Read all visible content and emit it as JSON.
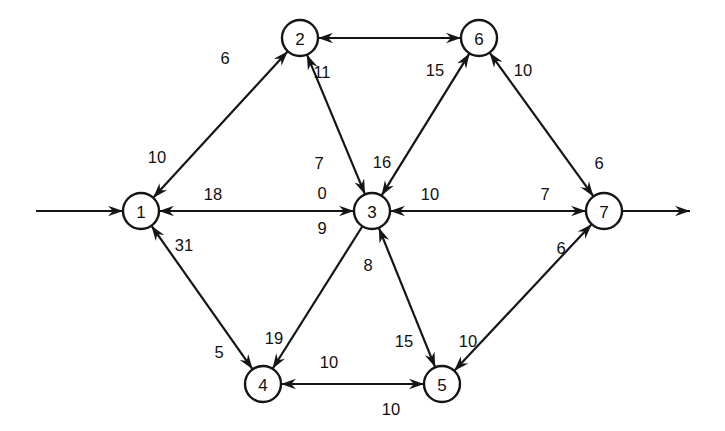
{
  "diagram": {
    "type": "directed-network-graph",
    "title": "",
    "background_color": "#ffffff",
    "line_color": "#151515",
    "node_fill": "#ffffff",
    "node_radius": 18,
    "nodes": [
      {
        "id": "1",
        "label": "1",
        "x": 141,
        "y": 211
      },
      {
        "id": "2",
        "label": "2",
        "x": 300,
        "y": 38
      },
      {
        "id": "3",
        "label": "3",
        "x": 372,
        "y": 211
      },
      {
        "id": "4",
        "label": "4",
        "x": 263,
        "y": 384
      },
      {
        "id": "5",
        "label": "5",
        "x": 442,
        "y": 384
      },
      {
        "id": "6",
        "label": "6",
        "x": 479,
        "y": 38
      },
      {
        "id": "7",
        "label": "7",
        "x": 604,
        "y": 211
      }
    ],
    "edges": [
      {
        "from": "1",
        "to": "2",
        "weight": "6",
        "label_x": 225,
        "label_y": 58,
        "arrow": "to"
      },
      {
        "from": "2",
        "to": "1",
        "weight": "10",
        "label_x": 157,
        "label_y": 157,
        "arrow": "to"
      },
      {
        "from": "2",
        "to": "6",
        "weight": "",
        "label_x": 390,
        "label_y": 20,
        "arrow": "both"
      },
      {
        "from": "3",
        "to": "2",
        "weight": "11",
        "label_x": 322,
        "label_y": 72,
        "arrow": "to"
      },
      {
        "from": "2",
        "to": "3",
        "weight": "7",
        "label_x": 319,
        "label_y": 163,
        "arrow": "to"
      },
      {
        "from": "1",
        "to": "3",
        "weight": "0",
        "label_x": 322,
        "label_y": 193,
        "arrow": "to"
      },
      {
        "from": "3",
        "to": "1",
        "weight": "18",
        "label_x": 213,
        "label_y": 194,
        "arrow": "to"
      },
      {
        "from": "1",
        "to": "3",
        "weight": "9",
        "label_x": 322,
        "label_y": 228,
        "arrow": "none"
      },
      {
        "from": "3",
        "to": "6",
        "weight": "15",
        "label_x": 435,
        "label_y": 70,
        "arrow": "to"
      },
      {
        "from": "6",
        "to": "3",
        "weight": "16",
        "label_x": 382,
        "label_y": 162,
        "arrow": "to"
      },
      {
        "from": "7",
        "to": "6",
        "weight": "10",
        "label_x": 523,
        "label_y": 70,
        "arrow": "to"
      },
      {
        "from": "6",
        "to": "7",
        "weight": "6",
        "label_x": 599,
        "label_y": 163,
        "arrow": "to"
      },
      {
        "from": "3",
        "to": "7",
        "weight": "7",
        "label_x": 545,
        "label_y": 194,
        "arrow": "to"
      },
      {
        "from": "7",
        "to": "3",
        "weight": "10",
        "label_x": 430,
        "label_y": 194,
        "arrow": "to"
      },
      {
        "from": "4",
        "to": "1",
        "weight": "31",
        "label_x": 184,
        "label_y": 245,
        "arrow": "to"
      },
      {
        "from": "1",
        "to": "4",
        "weight": "5",
        "label_x": 219,
        "label_y": 352,
        "arrow": "to"
      },
      {
        "from": "3",
        "to": "4",
        "weight": "19",
        "label_x": 274,
        "label_y": 338,
        "arrow": "to"
      },
      {
        "from": "5",
        "to": "3",
        "weight": "8",
        "label_x": 368,
        "label_y": 265,
        "arrow": "to"
      },
      {
        "from": "3",
        "to": "5",
        "weight": "15",
        "label_x": 404,
        "label_y": 341,
        "arrow": "to"
      },
      {
        "from": "5",
        "to": "4",
        "weight": "10",
        "label_x": 329,
        "label_y": 362,
        "arrow": "to"
      },
      {
        "from": "4",
        "to": "5",
        "weight": "10",
        "label_x": 391,
        "label_y": 409,
        "arrow": "to"
      },
      {
        "from": "5",
        "to": "7",
        "weight": "6",
        "label_x": 561,
        "label_y": 248,
        "arrow": "to"
      },
      {
        "from": "7",
        "to": "5",
        "weight": "10",
        "label_x": 468,
        "label_y": 341,
        "arrow": "to"
      }
    ],
    "external_edges": [
      {
        "name": "source-inflow",
        "x1": 36,
        "y1": 211,
        "x2": 123,
        "y2": 211,
        "arrow": "to"
      },
      {
        "name": "sink-outflow",
        "x1": 622,
        "y1": 211,
        "x2": 690,
        "y2": 211,
        "arrow": "to"
      }
    ]
  }
}
